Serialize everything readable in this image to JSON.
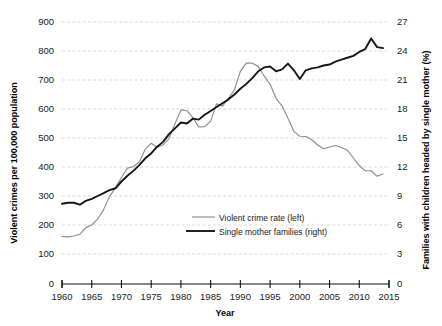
{
  "chart_data": {
    "type": "line",
    "title": "",
    "xlabel": "Year",
    "ylabel": "Violent crimes per 100,000 population",
    "y2label": "Families with children headed by single mother (%)",
    "xlim": [
      1960,
      2015
    ],
    "ylim": [
      0,
      900
    ],
    "y2lim": [
      0,
      27
    ],
    "xticks": [
      1960,
      1965,
      1970,
      1975,
      1980,
      1985,
      1990,
      1995,
      2000,
      2005,
      2010,
      2015
    ],
    "yticks": [
      0,
      100,
      200,
      300,
      400,
      500,
      600,
      700,
      800,
      900
    ],
    "y2ticks": [
      0,
      3,
      6,
      9,
      12,
      15,
      18,
      21,
      24,
      27
    ],
    "grid": true,
    "legend_position": "center-bottom-inside",
    "colors": {
      "crime": "#8d8d8d",
      "single_mother": "#161616",
      "gridline": "#c9c9c9",
      "axis": "#111111"
    },
    "x": [
      1960,
      1961,
      1962,
      1963,
      1964,
      1965,
      1966,
      1967,
      1968,
      1969,
      1970,
      1971,
      1972,
      1973,
      1974,
      1975,
      1976,
      1977,
      1978,
      1979,
      1980,
      1981,
      1982,
      1983,
      1984,
      1985,
      1986,
      1987,
      1988,
      1989,
      1990,
      1991,
      1992,
      1993,
      1994,
      1995,
      1996,
      1997,
      1998,
      1999,
      2000,
      2001,
      2002,
      2003,
      2004,
      2005,
      2006,
      2007,
      2008,
      2009,
      2010,
      2011,
      2012,
      2013,
      2014
    ],
    "series": [
      {
        "name": "Violent crime rate (left)",
        "axis": "left",
        "color": "#8d8d8d",
        "values": [
          161,
          159,
          162,
          168,
          191,
          200,
          220,
          253,
          298,
          329,
          364,
          396,
          401,
          417,
          461,
          482,
          468,
          476,
          498,
          549,
          597,
          594,
          571,
          538,
          539,
          558,
          618,
          610,
          637,
          666,
          730,
          758,
          758,
          747,
          714,
          685,
          637,
          611,
          568,
          523,
          506,
          505,
          494,
          476,
          463,
          469,
          474,
          467,
          458,
          431,
          405,
          387,
          387,
          368,
          376
        ]
      },
      {
        "name": "Single mother families (right)",
        "axis": "right",
        "color": "#161616",
        "values": [
          8.2,
          8.3,
          8.3,
          8.1,
          8.5,
          8.7,
          9.0,
          9.3,
          9.6,
          9.8,
          10.5,
          11.1,
          11.6,
          12.2,
          12.9,
          13.4,
          14.1,
          14.6,
          15.4,
          16.0,
          16.6,
          16.5,
          17.0,
          16.9,
          17.4,
          17.8,
          18.2,
          18.6,
          19.0,
          19.5,
          20.1,
          20.6,
          21.2,
          21.9,
          22.3,
          22.4,
          21.9,
          22.1,
          22.7,
          22.0,
          21.1,
          22.0,
          22.2,
          22.3,
          22.5,
          22.6,
          22.9,
          23.1,
          23.3,
          23.5,
          23.9,
          24.2,
          25.3,
          24.4,
          24.3
        ]
      }
    ]
  },
  "axes": {
    "left_title": "Violent crimes per 100,000 population",
    "right_title": "Families with children headed by single mother (%)",
    "bottom_title": "Year"
  },
  "legend": {
    "entries": [
      {
        "label": "Violent crime rate (left)",
        "color": "#8d8d8d",
        "weight": "thin"
      },
      {
        "label": "Single mother families (right)",
        "color": "#161616",
        "weight": "thick"
      }
    ]
  }
}
